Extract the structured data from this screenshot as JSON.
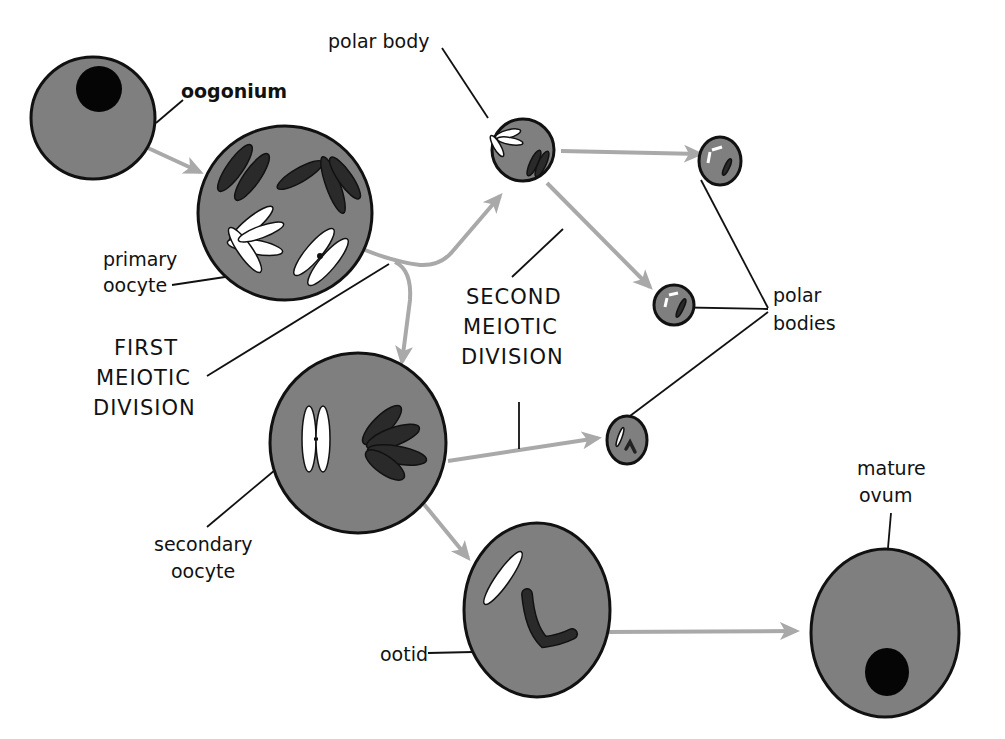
{
  "diagram": {
    "type": "oogenesis-meiosis-flow",
    "colors": {
      "cell_fill": "#7f7f7f",
      "arrow": "#a9a9a9",
      "outline": "#111111",
      "nucleus": "#050505",
      "chromosome_dark": "#2a2a2a",
      "chromosome_light": "#ffffff"
    },
    "labels": {
      "oogonium": "oogonium",
      "primary_oocyte_1": "primary",
      "primary_oocyte_2": "oocyte",
      "first_division_1": "FIRST",
      "first_division_2": "MEIOTIC",
      "first_division_3": "DIVISION",
      "polar_body": "polar body",
      "second_division_1": "SECOND",
      "second_division_2": "MEIOTIC",
      "second_division_3": "DIVISION",
      "polar_bodies_1": "polar",
      "polar_bodies_2": "bodies",
      "secondary_oocyte_1": "secondary",
      "secondary_oocyte_2": "oocyte",
      "ootid": "ootid",
      "mature_ovum_1": "mature",
      "mature_ovum_2": "ovum"
    },
    "nodes": [
      {
        "id": "oogonium",
        "label": "oogonium"
      },
      {
        "id": "primary-oocyte",
        "label": "primary oocyte"
      },
      {
        "id": "polar-body-1",
        "label": "polar body"
      },
      {
        "id": "secondary-oocyte",
        "label": "secondary oocyte"
      },
      {
        "id": "polar-body-2a",
        "label": "polar bodies"
      },
      {
        "id": "polar-body-2b",
        "label": "polar bodies"
      },
      {
        "id": "polar-body-2c",
        "label": "polar bodies"
      },
      {
        "id": "ootid",
        "label": "ootid"
      },
      {
        "id": "mature-ovum",
        "label": "mature ovum"
      }
    ],
    "edges": [
      {
        "from": "oogonium",
        "to": "primary-oocyte"
      },
      {
        "from": "primary-oocyte",
        "to": "polar-body-1",
        "stage": "FIRST MEIOTIC DIVISION"
      },
      {
        "from": "primary-oocyte",
        "to": "secondary-oocyte",
        "stage": "FIRST MEIOTIC DIVISION"
      },
      {
        "from": "polar-body-1",
        "to": "polar-body-2a",
        "stage": "SECOND MEIOTIC DIVISION"
      },
      {
        "from": "polar-body-1",
        "to": "polar-body-2b",
        "stage": "SECOND MEIOTIC DIVISION"
      },
      {
        "from": "secondary-oocyte",
        "to": "polar-body-2c",
        "stage": "SECOND MEIOTIC DIVISION"
      },
      {
        "from": "secondary-oocyte",
        "to": "ootid"
      },
      {
        "from": "ootid",
        "to": "mature-ovum"
      }
    ]
  }
}
